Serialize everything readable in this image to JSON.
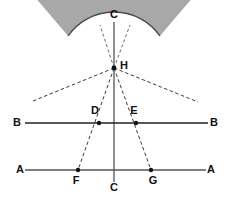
{
  "figure": {
    "type": "geometry-diagram",
    "title": "",
    "background_color": "#ffffff",
    "stroke_color": "#4a4a4a",
    "dashed_color": "#5a5a5a",
    "fill_color": "#a8a8a8",
    "point_color": "#111111",
    "label_color": "#111111"
  },
  "labels": {
    "c_top": "C",
    "c_bottom": "C",
    "h": "H",
    "b_left": "B",
    "b_right": "B",
    "d": "D",
    "e": "E",
    "a_left": "A",
    "a_right": "A",
    "f": "F",
    "g": "G"
  },
  "points": {
    "H": {
      "x": 114,
      "y": 68
    },
    "D": {
      "x": 99,
      "y": 123
    },
    "E": {
      "x": 136,
      "y": 123
    },
    "F": {
      "x": 78,
      "y": 170
    },
    "G": {
      "x": 151,
      "y": 170
    },
    "B_left": {
      "x": 30,
      "y": 123
    },
    "B_right": {
      "x": 202,
      "y": 123
    },
    "C_bottom": {
      "x": 114,
      "y": 176
    }
  },
  "label_positions": {
    "c_top": {
      "x": 114,
      "y": 15
    },
    "h": {
      "x": 124,
      "y": 66
    },
    "b_left": {
      "x": 17,
      "y": 123
    },
    "b_right": {
      "x": 214,
      "y": 123
    },
    "d": {
      "x": 95,
      "y": 111
    },
    "e": {
      "x": 134,
      "y": 111
    },
    "a_left": {
      "x": 20,
      "y": 170
    },
    "a_right": {
      "x": 211,
      "y": 170
    },
    "f": {
      "x": 76,
      "y": 181
    },
    "g": {
      "x": 153,
      "y": 181
    },
    "c_bottom": {
      "x": 114,
      "y": 188
    }
  },
  "lines": {
    "axis_c": {
      "label": "vertical-axis-C-to-C",
      "x1": 114,
      "y1": 22,
      "x2": 114,
      "y2": 182
    },
    "line_b": {
      "label": "horizontal-chord-B-B",
      "x1": 25,
      "y1": 123,
      "x2": 208,
      "y2": 123
    },
    "line_a": {
      "label": "horizontal-chord-A-A",
      "x1": 25,
      "y1": 170,
      "x2": 206,
      "y2": 170
    }
  },
  "arcs": {
    "outer_arc": {
      "label": "outer-arc-B-C-B",
      "center_x": 114,
      "center_y": 68,
      "radius": 108,
      "start_deg": 222,
      "end_deg": 318
    },
    "inner_arc": {
      "label": "inner-arc-D-E",
      "center_x": 114,
      "center_y": 68,
      "radius": 56,
      "start_deg": 215,
      "end_deg": 325
    }
  },
  "dashed_rays": {
    "ray_up_left": {
      "label": "dashed-ray-up-left",
      "x1": 114,
      "y1": 68,
      "x2": 100,
      "y2": 25
    },
    "ray_up_right": {
      "label": "dashed-ray-up-right",
      "x1": 114,
      "y1": 68,
      "x2": 130,
      "y2": 25
    },
    "ray_to_B_left": {
      "label": "dashed-ray-H-to-B-left",
      "x1": 114,
      "y1": 68,
      "x2": 33,
      "y2": 101
    },
    "ray_to_B_right": {
      "label": "dashed-ray-H-to-B-right",
      "x1": 114,
      "y1": 68,
      "x2": 198,
      "y2": 102
    },
    "ray_to_F": {
      "label": "dashed-ray-H-to-F",
      "x1": 114,
      "y1": 68,
      "x2": 78,
      "y2": 170
    },
    "ray_to_G": {
      "label": "dashed-ray-H-to-G",
      "x1": 114,
      "y1": 68,
      "x2": 151,
      "y2": 170
    }
  },
  "shading": {
    "label": "shaded-annulus-sector",
    "description": "gray band between inner arc and outer arc"
  }
}
